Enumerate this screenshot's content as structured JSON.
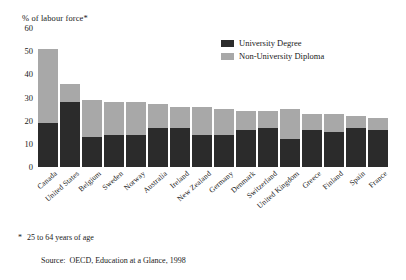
{
  "chart_data": {
    "type": "bar",
    "subtype": "stacked-vertical",
    "title": "",
    "ylabel": "% of labour force*",
    "xlabel": "",
    "ylim": [
      0,
      60
    ],
    "yticks": [
      0,
      10,
      20,
      30,
      40,
      50,
      60
    ],
    "grid": false,
    "legend_position": "top-right",
    "categories": [
      "Canada",
      "United States",
      "Belgium",
      "Sweden",
      "Norway",
      "Australia",
      "Ireland",
      "New Zealand",
      "Germany",
      "Denmark",
      "Switzerland",
      "United Kingdom",
      "Greece",
      "Finland",
      "Spain",
      "France"
    ],
    "series": [
      {
        "name": "University Degree",
        "color": "#2b2b2b",
        "values": [
          19,
          28,
          13,
          14,
          14,
          17,
          17,
          14,
          14,
          16,
          17,
          12,
          16,
          15,
          17,
          16
        ]
      },
      {
        "name": "Non-University Diploma",
        "color": "#a8a8a8",
        "values": [
          32,
          8,
          16,
          14,
          14,
          10,
          9,
          12,
          11,
          8,
          7,
          13,
          7,
          8,
          5,
          5
        ]
      }
    ],
    "totals": [
      51,
      36,
      29,
      28,
      28,
      27,
      26,
      26,
      25,
      24,
      24,
      25,
      23,
      23,
      22,
      21
    ]
  },
  "legend": {
    "items": [
      {
        "label": "University Degree",
        "color": "#2b2b2b"
      },
      {
        "label": "Non-University Diploma",
        "color": "#a8a8a8"
      }
    ]
  },
  "notes": {
    "footnote_marker": "*",
    "footnote_text": "25 to 64 years of age",
    "source_label": "Source:",
    "source_text": "OECD, Education at a Glance, 1998"
  }
}
